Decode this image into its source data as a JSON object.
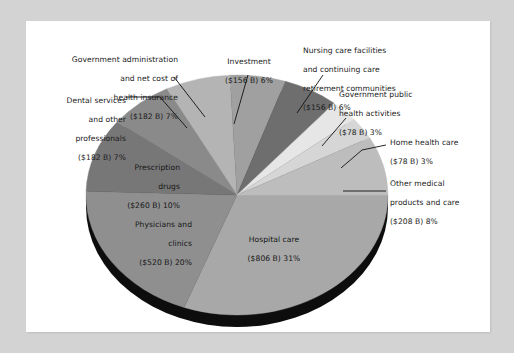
{
  "page": {
    "background_color": "#d3d3d3",
    "panel_color": "#ffffff"
  },
  "chart_data": {
    "type": "pie",
    "title": "",
    "subtitle": "",
    "xlabel": "",
    "ylabel": "",
    "legend_position": "callout-labels",
    "grid": false,
    "style": "3d-pie",
    "base_color": "#111111",
    "categories": [
      "Hospital care",
      "Physicians and clinics",
      "Prescription drugs",
      "Dental services and other professionals",
      "Government administration and net cost of health insurance",
      "Investment",
      "Nursing care facilities and continuing care retirement communities",
      "Government public health activities",
      "Home health care",
      "Other medical products and care"
    ],
    "values": [
      31,
      20,
      10,
      7,
      7,
      6,
      6,
      3,
      3,
      8
    ],
    "amounts_billions": [
      806,
      520,
      260,
      182,
      182,
      156,
      156,
      78,
      78,
      208
    ],
    "value_unit": "%",
    "amount_prefix": "$",
    "amount_suffix": " B",
    "slice_colors": [
      "#a8a8a8",
      "#8f8f8f",
      "#777777",
      "#8a8a8a",
      "#b4b4b4",
      "#a0a0a0",
      "#6e6e6e",
      "#e6e6e6",
      "#d6d6d6",
      "#bdbdbd"
    ]
  },
  "labels": {
    "gov_admin": {
      "line1": "Government administration",
      "line2": "and net cost of",
      "line3": "health insurance",
      "line4": "($182 B) 7%"
    },
    "dental": {
      "line1": "Dental services",
      "line2": "and other",
      "line3": "professionals",
      "line4": "($182 B) 7%"
    },
    "prescription": {
      "line1": "Prescription",
      "line2": "drugs",
      "line3": "($260 B) 10%"
    },
    "physicians": {
      "line1": "Physicians and",
      "line2": "clinics",
      "line3": "($520 B) 20%"
    },
    "hospital": {
      "line1": "Hospital care",
      "line2": "($806 B) 31%"
    },
    "investment": {
      "line1": "Investment",
      "line2": "($156 B) 6%"
    },
    "nursing": {
      "line1": "Nursing care facilities",
      "line2": "and continuing care",
      "line3": "retirement communities",
      "line4": "($156 B) 6%"
    },
    "gov_public_health": {
      "line1": "Government public",
      "line2": "health activities",
      "line3": "($78 B) 3%"
    },
    "home_health": {
      "line1": "Home health care",
      "line2": "($78 B) 3%"
    },
    "other_medical": {
      "line1": "Other medical",
      "line2": "products and care",
      "line3": "($208 B) 8%"
    }
  }
}
